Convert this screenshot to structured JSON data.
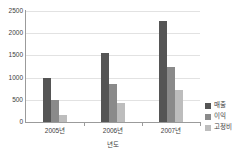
{
  "chart_data": {
    "type": "bar",
    "title": "",
    "xlabel": "년도",
    "ylabel": "",
    "ylim": [
      0,
      2500
    ],
    "yticks": [
      0,
      500,
      1000,
      1500,
      2000,
      2500
    ],
    "ytick_labels": [
      "0",
      "500",
      "1000",
      "1500",
      "2000",
      "2500"
    ],
    "categories": [
      "2005년",
      "2006년",
      "2007년"
    ],
    "grid": "horizontal",
    "legend_position": "right",
    "series": [
      {
        "name": "매출",
        "color": "#555555",
        "values": [
          1000,
          1550,
          2280
        ]
      },
      {
        "name": "이익",
        "color": "#8a8a8a",
        "values": [
          500,
          850,
          1250
        ]
      },
      {
        "name": "고정비",
        "color": "#bdbdbd",
        "values": [
          150,
          420,
          710
        ]
      }
    ]
  },
  "legend": {
    "items": [
      {
        "label": "매출"
      },
      {
        "label": "이익"
      },
      {
        "label": "고정비"
      }
    ]
  },
  "axes": {
    "x_title": "년도"
  }
}
